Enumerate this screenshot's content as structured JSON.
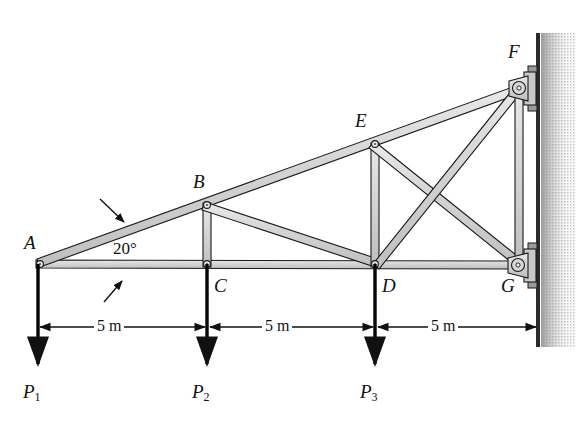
{
  "figure": {
    "type": "statics-truss-diagram",
    "background_color": "#ffffff",
    "member_fill": "#d2d2d2",
    "member_stroke": "#1a1a1a",
    "wall_color": "#2b2b2b",
    "load_color": "#000000"
  },
  "joints": [
    {
      "id": "A",
      "label": "A",
      "x": 38,
      "y": 264,
      "label_x": 24,
      "label_y": 233
    },
    {
      "id": "B",
      "label": "B",
      "x": 207,
      "y": 205,
      "label_x": 193,
      "label_y": 172
    },
    {
      "id": "C",
      "label": "C",
      "x": 207,
      "y": 264,
      "label_x": 214,
      "label_y": 276
    },
    {
      "id": "D",
      "label": "D",
      "x": 375,
      "y": 264,
      "label_x": 382,
      "label_y": 276
    },
    {
      "id": "E",
      "label": "E",
      "x": 375,
      "y": 144,
      "label_x": 355,
      "label_y": 111
    },
    {
      "id": "F",
      "label": "F",
      "x": 519,
      "y": 88,
      "label_x": 508,
      "label_y": 42
    },
    {
      "id": "G",
      "label": "G",
      "x": 518,
      "y": 265,
      "label_x": 501,
      "label_y": 276
    }
  ],
  "members": [
    {
      "name": "bottom-chord-A-G",
      "from": "A",
      "to": "G"
    },
    {
      "name": "top-chord-A-F",
      "from": "A",
      "to": "F"
    },
    {
      "name": "vertical-B-C",
      "from": "B",
      "to": "C"
    },
    {
      "name": "diagonal-B-D",
      "from": "B",
      "to": "D"
    },
    {
      "name": "vertical-E-D",
      "from": "E",
      "to": "D"
    },
    {
      "name": "diagonal-D-F",
      "from": "D",
      "to": "F"
    },
    {
      "name": "diagonal-E-G",
      "from": "E",
      "to": "G"
    },
    {
      "name": "wall-post-F-G",
      "from": "F",
      "to": "G"
    }
  ],
  "angle": {
    "label": "20°",
    "value": 20,
    "unit": "degrees",
    "text_x": 113,
    "text_y": 240,
    "leader_top": {
      "x1": 100,
      "y1": 199,
      "x2": 124,
      "y2": 222
    },
    "leader_bottom": {
      "x1": 104,
      "y1": 302,
      "x2": 122,
      "y2": 281
    }
  },
  "loads": [
    {
      "name": "P1",
      "label": "P",
      "subscript": "1",
      "joint": "A",
      "x": 38,
      "tail_y": 264,
      "head_y": 368,
      "label_x": 23,
      "label_y": 382
    },
    {
      "name": "P2",
      "label": "P",
      "subscript": "2",
      "joint": "C",
      "x": 207,
      "tail_y": 264,
      "head_y": 368,
      "label_x": 192,
      "label_y": 382
    },
    {
      "name": "P3",
      "label": "P",
      "subscript": "3",
      "joint": "D",
      "x": 375,
      "tail_y": 264,
      "head_y": 368,
      "label_x": 360,
      "label_y": 382
    }
  ],
  "dimensions": {
    "line_y": 327,
    "segments": [
      {
        "name": "dim-A-C",
        "label": "5 m",
        "x1": 38,
        "x2": 207,
        "text_x": 94,
        "text_y": 318
      },
      {
        "name": "dim-C-D",
        "label": "5 m",
        "x1": 207,
        "x2": 375,
        "text_x": 262,
        "text_y": 318
      },
      {
        "name": "dim-D-G",
        "label": "5 m",
        "x1": 375,
        "x2": 537,
        "text_x": 428,
        "text_y": 318
      }
    ],
    "extension_lines": [
      {
        "name": "ext-A",
        "x": 38
      },
      {
        "name": "ext-C",
        "x": 207
      },
      {
        "name": "ext-D",
        "x": 375
      },
      {
        "name": "ext-G",
        "x": 537
      }
    ]
  },
  "wall": {
    "name": "support-wall",
    "x": 537,
    "top_y": 33,
    "bottom_y": 347,
    "hatch_width": 36,
    "line_width": 4
  },
  "supports": [
    {
      "name": "pin-support-F",
      "joint": "F",
      "x": 519,
      "y": 88
    },
    {
      "name": "pin-support-G",
      "joint": "G",
      "x": 518,
      "y": 265
    }
  ]
}
